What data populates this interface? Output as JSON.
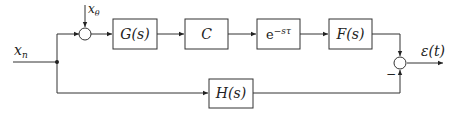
{
  "diagram": {
    "type": "block_diagram",
    "inputs": {
      "main": "x_n",
      "disturbance": "x_θ"
    },
    "output": "ε(t)",
    "blocks": [
      {
        "id": "G",
        "label": "G(s)"
      },
      {
        "id": "C",
        "label": "C"
      },
      {
        "id": "delay",
        "label": "e^{-sτ}",
        "base": "e",
        "exponent": "−sτ"
      },
      {
        "id": "F",
        "label": "F(s)"
      },
      {
        "id": "H",
        "label": "H(s)"
      }
    ],
    "summing_junctions": [
      {
        "id": "sum1",
        "inputs": [
          "x_n",
          "x_θ"
        ],
        "signs": [
          "+",
          "+"
        ]
      },
      {
        "id": "sum2",
        "inputs": [
          "F(s)",
          "H(s)"
        ],
        "signs": [
          "+",
          "−"
        ]
      }
    ],
    "labels": {
      "xn": "x",
      "xn_sub": "n",
      "xtheta": "x",
      "xtheta_sub": "θ",
      "G": "G(s)",
      "C": "C",
      "delay_base": "e",
      "delay_exp": "−sτ",
      "F": "F(s)",
      "H": "H(s)",
      "output": "ε(t)",
      "minus": "−"
    }
  }
}
